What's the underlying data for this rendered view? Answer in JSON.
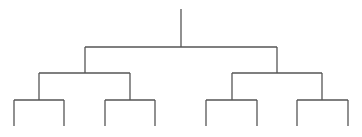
{
  "diagram": {
    "type": "binary-tree",
    "caption_cropped": "",
    "line_color": "#555555",
    "levels": 3,
    "leaf_count": 8,
    "edges": [
      {
        "id": "root-stem",
        "x1": 181,
        "y1": 9,
        "x2": 181,
        "y2": 47
      },
      {
        "id": "root-bar",
        "x1": 85,
        "y1": 47,
        "x2": 277,
        "y2": 47
      },
      {
        "id": "l-drop",
        "x1": 85,
        "y1": 47,
        "x2": 85,
        "y2": 73
      },
      {
        "id": "r-drop",
        "x1": 277,
        "y1": 47,
        "x2": 277,
        "y2": 73
      },
      {
        "id": "l-bar",
        "x1": 39,
        "y1": 73,
        "x2": 130,
        "y2": 73
      },
      {
        "id": "r-bar",
        "x1": 232,
        "y1": 73,
        "x2": 322,
        "y2": 73
      },
      {
        "id": "ll-drop",
        "x1": 39,
        "y1": 73,
        "x2": 39,
        "y2": 100
      },
      {
        "id": "lr-drop",
        "x1": 130,
        "y1": 73,
        "x2": 130,
        "y2": 100
      },
      {
        "id": "rl-drop",
        "x1": 232,
        "y1": 73,
        "x2": 232,
        "y2": 100
      },
      {
        "id": "rr-drop",
        "x1": 322,
        "y1": 73,
        "x2": 322,
        "y2": 100
      },
      {
        "id": "ll-bar",
        "x1": 14,
        "y1": 100,
        "x2": 64,
        "y2": 100
      },
      {
        "id": "lr-bar",
        "x1": 105,
        "y1": 100,
        "x2": 155,
        "y2": 100
      },
      {
        "id": "rl-bar",
        "x1": 206,
        "y1": 100,
        "x2": 257,
        "y2": 100
      },
      {
        "id": "rr-bar",
        "x1": 297,
        "y1": 100,
        "x2": 348,
        "y2": 100
      },
      {
        "id": "leaf-1",
        "x1": 14,
        "y1": 100,
        "x2": 14,
        "y2": 126
      },
      {
        "id": "leaf-2",
        "x1": 64,
        "y1": 100,
        "x2": 64,
        "y2": 126
      },
      {
        "id": "leaf-3",
        "x1": 105,
        "y1": 100,
        "x2": 105,
        "y2": 126
      },
      {
        "id": "leaf-4",
        "x1": 155,
        "y1": 100,
        "x2": 155,
        "y2": 126
      },
      {
        "id": "leaf-5",
        "x1": 206,
        "y1": 100,
        "x2": 206,
        "y2": 126
      },
      {
        "id": "leaf-6",
        "x1": 257,
        "y1": 100,
        "x2": 257,
        "y2": 126
      },
      {
        "id": "leaf-7",
        "x1": 297,
        "y1": 100,
        "x2": 297,
        "y2": 126
      },
      {
        "id": "leaf-8",
        "x1": 348,
        "y1": 100,
        "x2": 348,
        "y2": 126
      }
    ]
  }
}
